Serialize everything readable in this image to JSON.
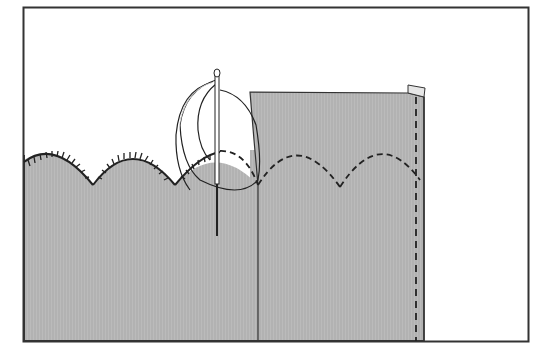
{
  "illustration": {
    "subject": "hand-sewing scalloped hem with blanket stitch",
    "colors": {
      "background": "#ffffff",
      "fabric": "#b4b4b4",
      "line": "#222222",
      "thread": "#ffffff"
    },
    "parts": [
      {
        "name": "frame-border"
      },
      {
        "name": "fabric-panel"
      },
      {
        "name": "blanket-stitched-scallops",
        "count": 3
      },
      {
        "name": "folded-facing-layer"
      },
      {
        "name": "dashed-scallop-seam",
        "count": 2
      },
      {
        "name": "dashed-side-seam"
      },
      {
        "name": "needle"
      },
      {
        "name": "thread-loop"
      }
    ]
  }
}
